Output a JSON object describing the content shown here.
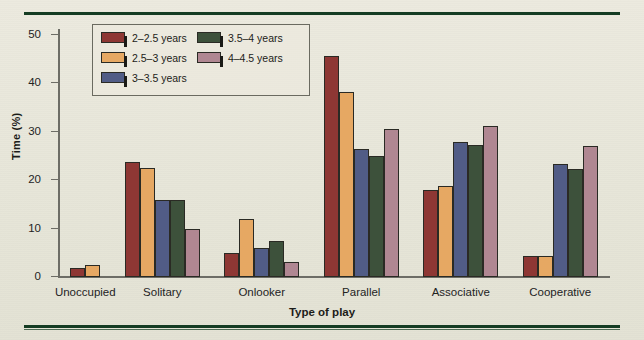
{
  "figure": {
    "background_color": "#e9e9dd",
    "rule_color": "#153c23"
  },
  "chart_data": {
    "type": "bar",
    "title": "",
    "xlabel": "Type of play",
    "ylabel": "Time (%)",
    "ylim": [
      0,
      50
    ],
    "yticks": [
      0,
      10,
      20,
      30,
      40,
      50
    ],
    "ytick_labels": [
      "0",
      "10",
      "20",
      "30",
      "40",
      "50"
    ],
    "grid": false,
    "legend_position": "upper left (inside axes)",
    "categories": [
      "Unoccupied",
      "Solitary",
      "Onlooker",
      "Parallel",
      "Associative",
      "Cooperative"
    ],
    "series": [
      {
        "name": "2–2.5 years",
        "color": "#8e3734",
        "values": [
          1.8,
          23.7,
          5.0,
          45.7,
          18.0,
          4.3
        ]
      },
      {
        "name": "2.5–3 years",
        "color": "#e6a863",
        "values": [
          2.5,
          22.5,
          12.0,
          38.2,
          18.8,
          4.3
        ]
      },
      {
        "name": "3–3.5 years",
        "color": "#515c86",
        "values": [
          0,
          16.0,
          6.0,
          26.5,
          27.8,
          23.3
        ]
      },
      {
        "name": "3.5–4 years",
        "color": "#3d513b",
        "values": [
          0,
          16.0,
          7.5,
          25.0,
          27.3,
          22.3
        ]
      },
      {
        "name": "4–4.5 years",
        "color": "#b08792",
        "values": [
          0,
          10.0,
          3.0,
          30.5,
          31.3,
          27.0
        ]
      }
    ]
  }
}
